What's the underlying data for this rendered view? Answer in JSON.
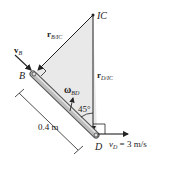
{
  "labels": {
    "ic": "IC",
    "r_b_ic_main": "r",
    "r_b_ic_sub": "B/IC",
    "r_d_ic_main": "r",
    "r_d_ic_sub": "D/IC",
    "v_b_main": "v",
    "v_b_sub": "B",
    "point_b": "B",
    "point_d": "D",
    "omega_main": "ω",
    "omega_sub": "BD",
    "angle": "45°",
    "length": "0.4 m",
    "v_d_main": "v",
    "v_d_sub": "D",
    "v_d_value": " = 3 m/s"
  },
  "colors": {
    "triangle_fill": "#e9e9e9",
    "bar_fill": "#b8b8b8",
    "line": "#222222"
  }
}
